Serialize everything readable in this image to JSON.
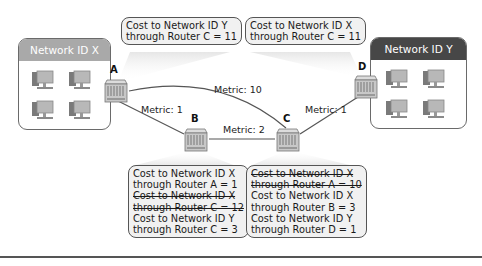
{
  "networks": {
    "x": {
      "label": "Network ID X",
      "header_color": "#a9a9a9",
      "computers": 4
    },
    "y": {
      "label": "Network ID Y",
      "header_color": "#474747",
      "computers": 4
    }
  },
  "routers": [
    {
      "id": "A",
      "label": "A"
    },
    {
      "id": "B",
      "label": "B"
    },
    {
      "id": "C",
      "label": "C"
    },
    {
      "id": "D",
      "label": "D"
    }
  ],
  "links": [
    {
      "from": "A",
      "to": "C",
      "metric": "Metric: 10"
    },
    {
      "from": "A",
      "to": "B",
      "metric": "Metric: 1"
    },
    {
      "from": "B",
      "to": "C",
      "metric": "Metric: 2"
    },
    {
      "from": "C",
      "to": "D",
      "metric": "Metric: 1"
    }
  ],
  "bubbles": {
    "router_a": {
      "lines": [
        {
          "text": "Cost to Network ID Y",
          "struck": false
        },
        {
          "text": "through Router C = 11",
          "struck": false
        }
      ]
    },
    "router_d": {
      "lines": [
        {
          "text": "Cost to Network ID X",
          "struck": false
        },
        {
          "text": "through Router C = 11",
          "struck": false
        }
      ]
    },
    "router_b": {
      "lines": [
        {
          "text": "Cost to Network ID X",
          "struck": false
        },
        {
          "text": "through Router A = 1",
          "struck": false
        },
        {
          "text": "Cost to Network ID X",
          "struck": true
        },
        {
          "text": "through Router C = 12",
          "struck": true
        },
        {
          "text": "Cost to Network ID Y",
          "struck": false
        },
        {
          "text": "through Router C = 3",
          "struck": false
        }
      ]
    },
    "router_c": {
      "lines": [
        {
          "text": "Cost to Network ID X",
          "struck": true
        },
        {
          "text": "through Router A = 10",
          "struck": true
        },
        {
          "text": "Cost to Network ID X",
          "struck": false
        },
        {
          "text": "through Router B = 3",
          "struck": false
        },
        {
          "text": "Cost to Network ID Y",
          "struck": false
        },
        {
          "text": "through Router D = 1",
          "struck": false
        }
      ]
    }
  },
  "colors": {
    "bubble_fill": "#f1f1f1",
    "bubble_border": "#555555",
    "link": "#555555",
    "router_body": "#c8c8c8"
  }
}
